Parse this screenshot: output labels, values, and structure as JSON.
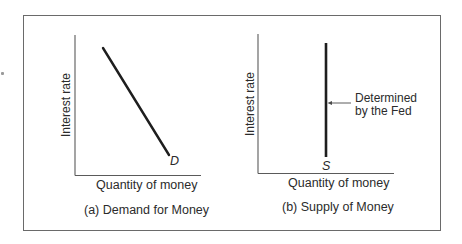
{
  "figure": {
    "panels": [
      {
        "id": "a",
        "caption": "(a) Demand for Money",
        "y_axis_label": "Interest rate",
        "x_axis_label": "Quantity of money",
        "curve_label": "D",
        "curve_type": "downward-sloping line"
      },
      {
        "id": "b",
        "caption": "(b) Supply of Money",
        "y_axis_label": "Interest rate",
        "x_axis_label": "Quantity of money",
        "curve_label": "S",
        "curve_type": "vertical line",
        "annotation_line1": "Determined",
        "annotation_line2": "by the Fed"
      }
    ]
  },
  "colors": {
    "ink": "#1e1e1e",
    "frame": "#6a6a6a",
    "axis": "#5a5a5a"
  }
}
